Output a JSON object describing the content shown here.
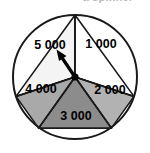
{
  "figure": {
    "type": "spinner-wheel",
    "title_partial": "a spinner",
    "segment_count": 5,
    "outline_color": "#1a1a1a",
    "pointer": {
      "name": "spinner-arrow",
      "points_to": "5 000",
      "color": "#000000",
      "angle_degrees": 234
    },
    "segments": [
      {
        "label": "1 000",
        "color": "#ffffff",
        "start_angle": 270,
        "end_angle": 342
      },
      {
        "label": "2 000",
        "color": "#b2b2b2",
        "start_angle": 342,
        "end_angle": 54
      },
      {
        "label": "3 000",
        "color": "#8c8c8c",
        "start_angle": 54,
        "end_angle": 126
      },
      {
        "label": "4 000",
        "color": "#a9a9a9",
        "start_angle": 126,
        "end_angle": 198
      },
      {
        "label": "5 000",
        "color": "#f4f4f4",
        "start_angle": 198,
        "end_angle": 270
      }
    ],
    "geometry": {
      "center_x": 75,
      "center_y": 77,
      "radius": 62
    }
  }
}
